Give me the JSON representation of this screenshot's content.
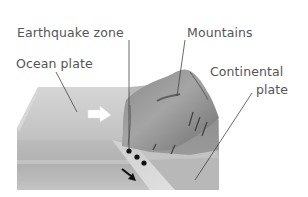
{
  "diagram": {
    "labels": {
      "earthquake_zone": "Earthquake zone",
      "mountains": "Mountains",
      "ocean_plate": "Ocean plate",
      "continental_line1": "Continental",
      "continental_line2": "plate"
    },
    "elements": [
      {
        "name": "ocean-plate",
        "description": "light grey block surface on the left"
      },
      {
        "name": "continental-plate",
        "description": "darker grey block on the right with raised mountains"
      },
      {
        "name": "mountains",
        "description": "dark raised landform on top of continental plate"
      },
      {
        "name": "subducting-slab",
        "description": "pale band descending under the continent"
      },
      {
        "name": "plate-motion-arrow",
        "description": "white arrow pointing right on ocean plate surface"
      },
      {
        "name": "subduction-arrow",
        "description": "black arrow pointing down-right along slab"
      },
      {
        "name": "earthquake-dots",
        "description": "three black dots marking earthquake foci"
      }
    ],
    "colors": {
      "text": "#555555",
      "leader_line": "#444444",
      "ocean_surface": "#c8c8c8",
      "ocean_side": "#b4b4b4",
      "mountain_dark": "#7a7a7a",
      "mountain_light": "#9a9a9a",
      "slab": "#d8d8d8",
      "dots": "#111111"
    }
  }
}
